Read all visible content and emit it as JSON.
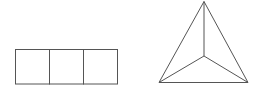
{
  "canvas": {
    "width": 260,
    "height": 91,
    "background": "#ffffff"
  },
  "stroke": {
    "color": "#555555",
    "width": 1
  },
  "figures": [
    {
      "name": "three-square-strip",
      "type": "rectangle-strip",
      "x": 15.5,
      "y": 49.5,
      "cell_width": 34,
      "height": 34.5,
      "cells": 3
    },
    {
      "name": "triangular-pyramid-top-view",
      "type": "triangle-with-center",
      "apex": [
        204,
        1.5
      ],
      "bottom_left": [
        159,
        82.5
      ],
      "bottom_right": [
        248,
        82.5
      ],
      "center": [
        204,
        56
      ]
    }
  ]
}
